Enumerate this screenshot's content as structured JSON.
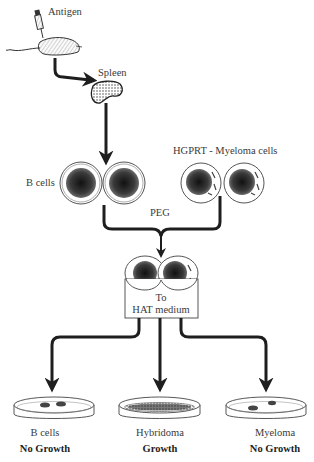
{
  "diagram": {
    "steps": {
      "antigen": "Antigen",
      "spleen": "Spleen",
      "b_cells": "B cells",
      "myeloma_cells": "HGPRT - Myeloma cells",
      "fusion_agent": "PEG",
      "medium_line1": "To",
      "medium_line2": "HAT medium"
    },
    "outcomes": [
      {
        "cell_type": "B cells",
        "result": "No Growth"
      },
      {
        "cell_type": "Hybridoma",
        "result": "Growth"
      },
      {
        "cell_type": "Myeloma",
        "result": "No Growth"
      }
    ],
    "colors": {
      "ink": "#1e1e1e",
      "outline": "#555555",
      "background": "#ffffff"
    }
  }
}
